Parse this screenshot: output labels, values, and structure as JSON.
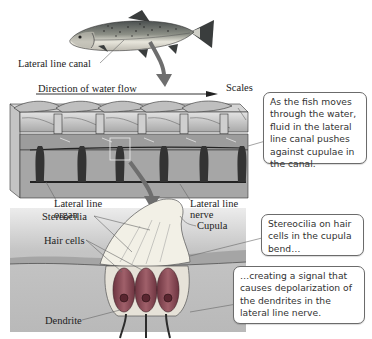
{
  "figure": {
    "fish": {
      "label_lateral_line_canal": "Lateral line canal"
    },
    "canal_section": {
      "label_direction": "Direction of water flow",
      "label_scales": "Scales",
      "label_lateral_line_organ_1": "Lateral line",
      "label_lateral_line_organ_2": "organ",
      "label_lateral_line_nerve_1": "Lateral line",
      "label_lateral_line_nerve_2": "nerve"
    },
    "organ_detail": {
      "label_stereocilia": "Stereocilia",
      "label_cupula": "Cupula",
      "label_hair_cells": "Hair cells",
      "label_dendrite": "Dendrite"
    },
    "callouts": [
      {
        "text": "As the fish moves through the water, fluid in the lateral line canal pushes against cupulae in the canal."
      },
      {
        "text": "Stereocilia on hair cells in the cupula bend…"
      },
      {
        "text": "…creating a signal that causes depolarization of the dendrites in the lateral line nerve."
      }
    ],
    "colors": {
      "arrow": "#6e6e6e",
      "hair_cell": "#8a4a55",
      "cupula": "#f2f0e6",
      "tissue": "#c9c9c9",
      "callout_border": "#6b6b6b"
    }
  }
}
